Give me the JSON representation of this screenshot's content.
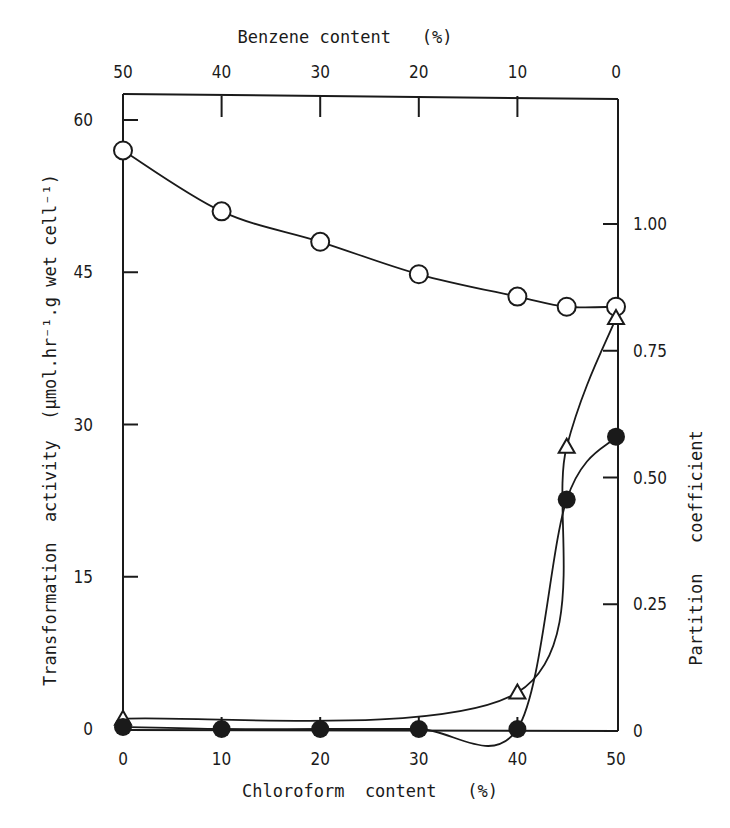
{
  "chart_data": {
    "type": "line",
    "title": "",
    "xlabel": "Chloroform content (%)",
    "x2label": "Benzene content (%)",
    "ylabel": "Transformation activity (μmol.hr⁻¹.g wet cell⁻¹)",
    "y2label": "Partition coefficient",
    "x_ticks": [
      "0",
      "10",
      "20",
      "30",
      "40",
      "50"
    ],
    "x2_ticks": [
      "50",
      "40",
      "30",
      "20",
      "10",
      "0"
    ],
    "y_ticks": [
      "0",
      "15",
      "30",
      "45",
      "60"
    ],
    "y2_ticks": [
      "0",
      "0.25",
      "0.50",
      "0.75",
      "1.00"
    ],
    "xlim": [
      0,
      50
    ],
    "ylim": [
      0,
      63
    ],
    "y2lim": [
      0,
      1.24
    ],
    "grid": false,
    "legend": "none",
    "series": [
      {
        "name": "open circles",
        "marker": "open-circle",
        "x": [
          0,
          10,
          20,
          30,
          40,
          45,
          50
        ],
        "values": [
          57.0,
          51.0,
          48.0,
          44.8,
          42.6,
          41.6,
          41.6
        ]
      },
      {
        "name": "open triangles",
        "marker": "open-triangle",
        "x": [
          0,
          40,
          45,
          50
        ],
        "values": [
          1.0,
          3.6,
          27.8,
          40.5
        ]
      },
      {
        "name": "filled circles",
        "marker": "filled-circle",
        "x": [
          0,
          10,
          20,
          30,
          40,
          45,
          50
        ],
        "values": [
          0.2,
          0.0,
          0.0,
          0.0,
          0.0,
          22.6,
          28.8
        ]
      }
    ]
  },
  "labels": {
    "top_axis_title": "Benzene content   (%)",
    "bottom_axis_title": "Chloroform  content   (%)",
    "left_axis_title": "Transformation  activity  (μmol.hr⁻¹.g wet cell⁻¹)",
    "right_axis_title": "Partition   coefficient"
  }
}
